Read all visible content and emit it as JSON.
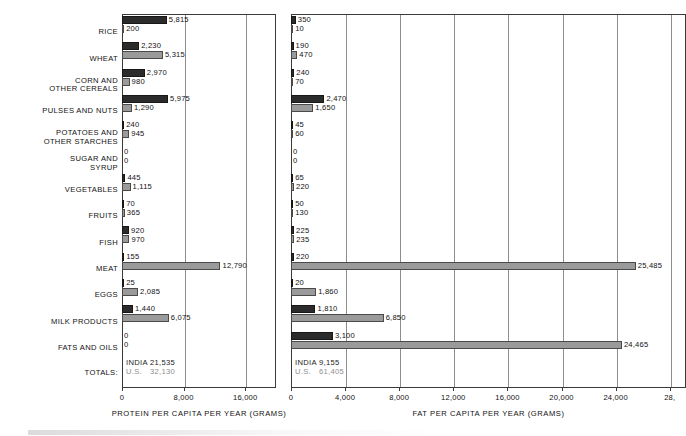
{
  "chart_data": [
    {
      "type": "bar",
      "title": "",
      "xlabel": "PROTEIN PER CAPITA PER YEAR (GRAMS)",
      "ylabel": "",
      "orientation": "horizontal",
      "xlim": [
        0,
        20000
      ],
      "xticks": [
        0,
        8000,
        16000
      ],
      "xticklabels": [
        "0",
        "8,000",
        "16,000"
      ],
      "gridlines": [
        8000,
        16000
      ],
      "grid": true,
      "legend": [
        "INDIA",
        "U.S."
      ],
      "legend_position": "none",
      "categories": [
        "RICE",
        "WHEAT",
        "CORN AND OTHER CEREALS",
        "PULSES AND NUTS",
        "POTATOES AND OTHER STARCHES",
        "SUGAR AND SYRUP",
        "VEGETABLES",
        "FRUITS",
        "FISH",
        "MEAT",
        "EGGS",
        "MILK PRODUCTS",
        "FATS AND OILS"
      ],
      "series": [
        {
          "name": "INDIA",
          "values": [
            5815,
            2230,
            2970,
            5975,
            240,
            0,
            445,
            70,
            920,
            155,
            25,
            1440,
            0
          ],
          "labels": [
            "5,815",
            "2,230",
            "2,970",
            "5,975",
            "240",
            "0",
            "445",
            "70",
            "920",
            "155",
            "25",
            "1,440",
            "0"
          ]
        },
        {
          "name": "U.S.",
          "values": [
            200,
            5315,
            980,
            1290,
            945,
            0,
            1115,
            365,
            970,
            12790,
            2085,
            6075,
            0
          ],
          "labels": [
            "200",
            "5,315",
            "980",
            "1,290",
            "945",
            "0",
            "1,115",
            "365",
            "970",
            "12,790",
            "2,085",
            "6,075",
            "0"
          ]
        }
      ],
      "totals": {
        "label": "TOTALS:",
        "india": "21,535",
        "us": "32,130",
        "india_name": "INDIA",
        "us_name": "U.S."
      }
    },
    {
      "type": "bar",
      "title": "",
      "xlabel": "FAT PER CAPITA PER YEAR (GRAMS)",
      "ylabel": "",
      "orientation": "horizontal",
      "xlim": [
        0,
        29200
      ],
      "xticks": [
        0,
        4000,
        8000,
        12000,
        16000,
        20000,
        24000,
        28000
      ],
      "xticklabels": [
        "0",
        "4,000",
        "8,000",
        "12,000",
        "16,000",
        "20,000",
        "24,000",
        "28,"
      ],
      "gridlines": [
        4000,
        8000,
        12000,
        16000,
        20000,
        24000,
        28000
      ],
      "grid": true,
      "legend": [
        "INDIA",
        "U.S."
      ],
      "legend_position": "none",
      "categories": [
        "RICE",
        "WHEAT",
        "CORN AND OTHER CEREALS",
        "PULSES AND NUTS",
        "POTATOES AND OTHER STARCHES",
        "SUGAR AND SYRUP",
        "VEGETABLES",
        "FRUITS",
        "FISH",
        "MEAT",
        "EGGS",
        "MILK PRODUCTS",
        "FATS AND OILS"
      ],
      "series": [
        {
          "name": "INDIA",
          "values": [
            350,
            190,
            240,
            2470,
            45,
            0,
            65,
            50,
            225,
            220,
            20,
            1810,
            3100
          ],
          "labels": [
            "350",
            "190",
            "240",
            "2,470",
            "45",
            "0",
            "65",
            "50",
            "225",
            "220",
            "20",
            "1,810",
            "3,100"
          ]
        },
        {
          "name": "U.S.",
          "values": [
            10,
            470,
            70,
            1650,
            60,
            0,
            220,
            130,
            235,
            25485,
            1860,
            6850,
            24465
          ],
          "labels": [
            "10",
            "470",
            "70",
            "1,650",
            "60",
            "0",
            "220",
            "130",
            "235",
            "25,485",
            "1,860",
            "6,850",
            "24,465"
          ]
        }
      ],
      "totals": {
        "label": "",
        "india": "9,155",
        "us": "61,405",
        "india_name": "INDIA",
        "us_name": "U.S."
      }
    }
  ],
  "colors": {
    "india_bar": "#2b2b2b",
    "us_bar": "#9a9a9a",
    "axis": "#3a3a3a",
    "gridline": "#8d8d8d",
    "text": "#111111",
    "us_total_text": "#8e8e8e"
  }
}
